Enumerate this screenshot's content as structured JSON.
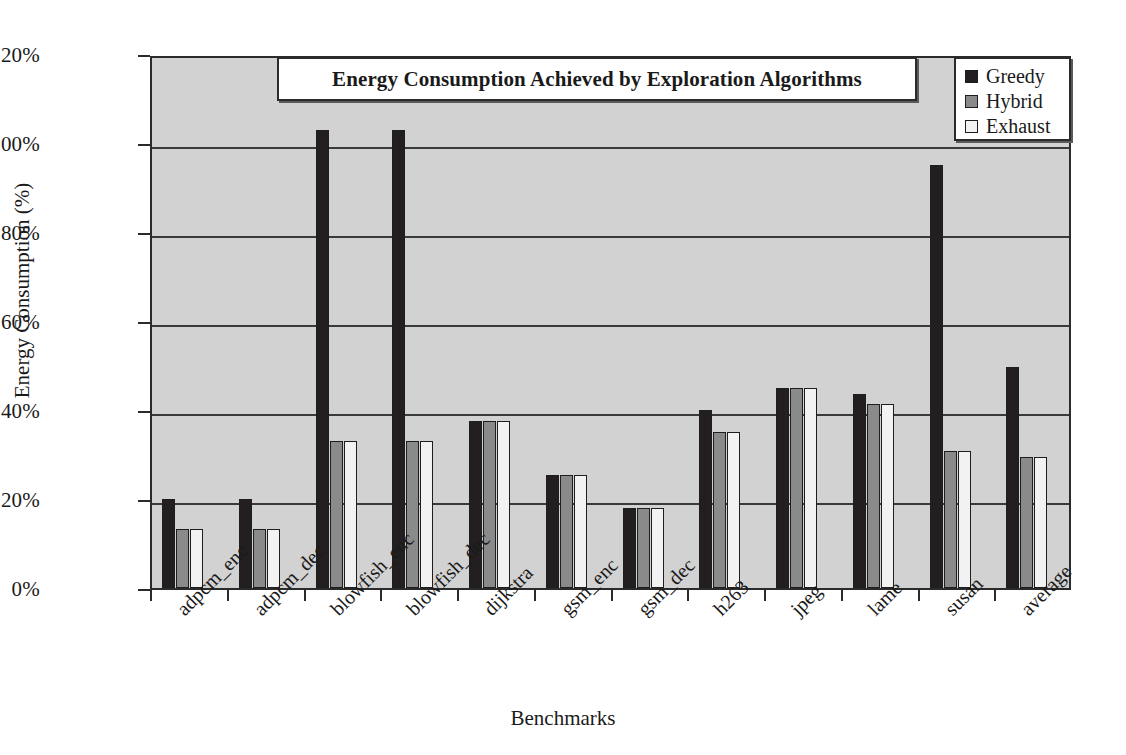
{
  "chart_data": {
    "type": "bar",
    "title": "Energy Consumption Achieved by Exploration Algorithms",
    "xlabel": "Benchmarks",
    "ylabel": "Energy Consumption (%)",
    "ylim": [
      0,
      120
    ],
    "ytick_labels": [
      "0%",
      "20%",
      "40%",
      "60%",
      "80%",
      "100%",
      "120%"
    ],
    "ytick_values": [
      0,
      20,
      40,
      60,
      80,
      100,
      120
    ],
    "grid": true,
    "legend_position": "top-right",
    "categories": [
      "adpcm_enc",
      "adpcm_dec",
      "blowfish_enc",
      "blowfish_dec",
      "dijkstra",
      "gsm_enc",
      "gsm_dec",
      "h263",
      "jpeg",
      "lame",
      "susan",
      "average"
    ],
    "series": [
      {
        "name": "Greedy",
        "color": "#231f20",
        "values": [
          20.0,
          20.0,
          103.0,
          103.0,
          37.5,
          25.3,
          18.0,
          40.0,
          45.0,
          43.5,
          95.0,
          49.7
        ]
      },
      {
        "name": "Hybrid",
        "color": "#8a8a8a",
        "values": [
          13.3,
          13.3,
          33.0,
          33.0,
          37.5,
          25.3,
          18.0,
          35.0,
          45.0,
          41.3,
          30.7,
          29.5
        ]
      },
      {
        "name": "Exhaust",
        "color": "#f2f2f2",
        "values": [
          13.3,
          13.3,
          33.0,
          33.0,
          37.5,
          25.3,
          18.0,
          35.0,
          45.0,
          41.3,
          30.7,
          29.5
        ]
      }
    ]
  },
  "colors": {
    "plot_background": "#d2d2d2",
    "axis": "#2b2b2b",
    "figure_background": "#ffffff"
  }
}
